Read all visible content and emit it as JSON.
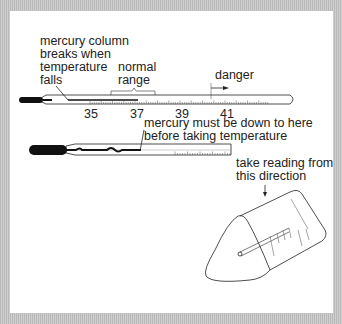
{
  "diagram": {
    "labels": {
      "mercury_break": [
        "mercury column",
        "breaks when",
        "temperature",
        "falls"
      ],
      "normal_range": [
        "normal",
        "range"
      ],
      "danger": "danger",
      "shake_down": [
        "mercury must be down to here",
        "before taking temperature"
      ],
      "reading_direction": [
        "take reading from",
        "this direction"
      ]
    },
    "scale_ticks": [
      "35",
      "37",
      "39",
      "41"
    ],
    "colors": {
      "ink": "#222222",
      "frame": "#c4c4c4",
      "background": "#ffffff"
    }
  }
}
